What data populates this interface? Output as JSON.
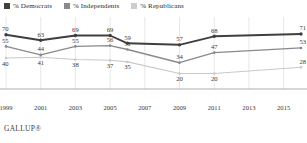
{
  "legend": {
    "items": [
      {
        "label": "% Democrats",
        "color": "#3f3f3f",
        "key": "democrats"
      },
      {
        "label": "% Independents",
        "color": "#8a8a8a",
        "key": "independents"
      },
      {
        "label": "% Republicans",
        "color": "#c9c9c9",
        "key": "republicans"
      }
    ]
  },
  "source": {
    "text": "GALLUP®"
  },
  "chart_data": {
    "type": "line",
    "title": "",
    "xlabel": "",
    "ylabel": "",
    "grid": "vertical",
    "legend_position": "top-left",
    "ylim": [
      0,
      80
    ],
    "xlim": [
      1999,
      2016
    ],
    "x": [
      1999,
      2001,
      2003,
      2005,
      2006,
      2009,
      2011,
      2016
    ],
    "tick_labels": [
      "1999",
      "2001",
      "2003",
      "2005",
      "2007",
      "2009",
      "2011",
      "2013",
      "2015"
    ],
    "tick_values": [
      1999,
      2001,
      2003,
      2005,
      2007,
      2009,
      2011,
      2013,
      2015
    ],
    "series": [
      {
        "name": "% Democrats",
        "color": "#3f3f3f",
        "values": [
          70,
          63,
          69,
          69,
          59,
          57,
          68,
          71
        ],
        "labels": [
          "70",
          "63",
          "69",
          "69",
          "59",
          "57",
          "68",
          "71"
        ]
      },
      {
        "name": "% Independents",
        "color": "#8a8a8a",
        "values": [
          55,
          44,
          55,
          56,
          51,
          34,
          47,
          53
        ],
        "labels": [
          "55",
          "44",
          "55",
          "56",
          "51",
          "34",
          "47",
          "53"
        ]
      },
      {
        "name": "% Republicans",
        "color": "#c9c9c9",
        "values": [
          40,
          41,
          38,
          37,
          35,
          20,
          20,
          28
        ],
        "labels": [
          "40",
          "41",
          "38",
          "37",
          "35",
          "20",
          "20",
          "28"
        ]
      }
    ]
  }
}
